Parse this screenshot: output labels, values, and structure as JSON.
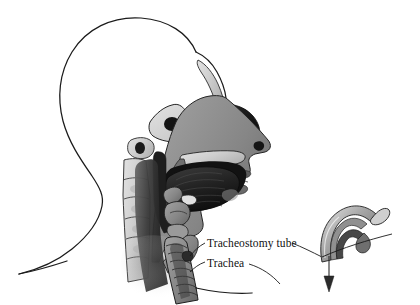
{
  "figure": {
    "background_color": "#ffffff",
    "width": 420,
    "height": 305
  },
  "labels": [
    {
      "id": "tracheostomy-tube",
      "text": "Tracheostomy tube",
      "x": 207,
      "y": 247,
      "has_left_leader": true,
      "has_right_leader": true
    },
    {
      "id": "trachea",
      "text": "Trachea",
      "x": 207,
      "y": 267,
      "has_left_leader": true,
      "has_right_leader": false
    }
  ],
  "anatomy": {
    "head_outline": "cranium and back-of-neck contour, thin black line on white",
    "structures": [
      "nasal cavity",
      "nasal turbinates",
      "sphenoid sinus",
      "hard palate",
      "soft palate",
      "tongue",
      "mandible",
      "oropharynx",
      "epiglottis",
      "larynx",
      "trachea",
      "cervical vertebrae",
      "spinal canal",
      "facial profile with nose and lips",
      "chest and shoulder contour"
    ]
  },
  "inset": {
    "id": "tracheostomy-tube-inset",
    "description": "curved tracheostomy tube with neck flange shown separately at lower right",
    "arrow_direction": "down",
    "arrow_meaning": "insertion direction into the trachea"
  },
  "colors": {
    "background": "#ffffff",
    "ink": "#1b1b1b",
    "bone_light": "#d9d9d9",
    "bone_mid": "#bdbdbd",
    "tissue_gray": "#8e8e8e",
    "tissue_dark": "#4a4a4a",
    "cavity_black": "#141414",
    "tube_light": "#cfcfcf",
    "tube_mid": "#8a8a8a",
    "tube_dark": "#3d3d3d",
    "text": "#111111"
  }
}
